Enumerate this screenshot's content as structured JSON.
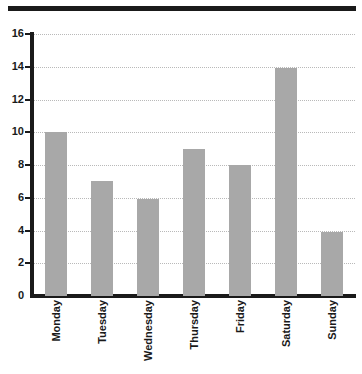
{
  "figure": {
    "background_color": "#ffffff",
    "top_rule_color": "#1a1a1a",
    "axis_color": "#1a1a1a",
    "gridline_color": "#b9b9b9",
    "bar_color": "#a8a8a8"
  },
  "chart_data": {
    "type": "bar",
    "title": "",
    "xlabel": "",
    "ylabel": "",
    "categories": [
      "Monday",
      "Tuesday",
      "Wednesday",
      "Thursday",
      "Friday",
      "Saturday",
      "Sunday"
    ],
    "values": [
      10,
      7,
      5.9,
      9,
      8,
      13.9,
      3.9
    ],
    "ylim": [
      0,
      16
    ],
    "ytick_step": 2,
    "yticks": [
      0,
      2,
      4,
      6,
      8,
      10,
      12,
      14,
      16
    ],
    "ytick_labels": [
      "0",
      "2",
      "4",
      "6",
      "8",
      "10",
      "12",
      "14",
      "16"
    ],
    "grid": true,
    "grid_axis": "y",
    "grid_style": "dotted",
    "legend": false,
    "legend_position": "none",
    "xtick_rotation": 90,
    "series": [
      {
        "name": "Value",
        "values": [
          10,
          7,
          5.9,
          9,
          8,
          13.9,
          3.9
        ]
      }
    ]
  }
}
